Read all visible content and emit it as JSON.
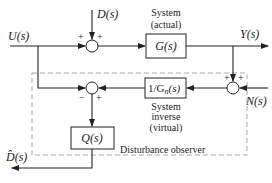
{
  "diagram": {
    "signals": {
      "input": "U(s)",
      "disturbance": "D(s)",
      "output": "Y(s)",
      "noise": "N(s)",
      "estimate": "D̂(s)"
    },
    "blocks": {
      "plant": {
        "label": "G(s)",
        "caption_line1": "System",
        "caption_line2": "(actual)"
      },
      "inverse": {
        "label": "1/Gn(s)",
        "label_main": "1/G",
        "label_sub": "n",
        "label_tail": "(s)",
        "caption_line1": "System",
        "caption_line2": "inverse",
        "caption_line3": "(virtual)"
      },
      "filter": {
        "label": "Q(s)"
      }
    },
    "junctions": {
      "top": {
        "left_sign": "+",
        "top_sign": "+"
      },
      "lower": {
        "left_sign": "−",
        "right_sign": "+"
      },
      "noise": {
        "top_left_sign": "+",
        "top_right_sign": "+"
      }
    },
    "observer_label": "Disturbance observer",
    "colors": {
      "line": "#222222",
      "dashed": "#aaaaaa",
      "background": "#ffffff"
    }
  }
}
